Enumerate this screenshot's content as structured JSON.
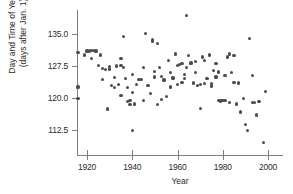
{
  "chart_data": {
    "type": "scatter",
    "title": "",
    "xlabel": "Year",
    "ylabel": "Day and Time of Year\n(days after Jan. 1)",
    "ylabel_lines": [
      "Day and Time of Year",
      "(days after Jan. 1)"
    ],
    "xlim": [
      1915,
      2003
    ],
    "ylim": [
      108.5,
      140.5
    ],
    "xticks": [
      1920,
      1940,
      1960,
      1980,
      2000
    ],
    "xtick_labels": [
      "1920",
      "1940",
      "1960",
      "1980",
      "2000"
    ],
    "yticks": [
      112.5,
      120.0,
      127.5,
      135.0
    ],
    "ytick_labels": [
      "112.5",
      "120.0",
      "127.5",
      "135.0"
    ],
    "grid": false,
    "legend": false,
    "marker": "filled-circle",
    "marker_color": "#4c4c4c",
    "axis_color": "#7d7d7d",
    "n_points": 111,
    "points": [
      {
        "x": 1916,
        "y": 130.6
      },
      {
        "x": 1916,
        "y": 122.6
      },
      {
        "x": 1916,
        "y": 119.8
      },
      {
        "x": 1919,
        "y": 130.1
      },
      {
        "x": 1920,
        "y": 131.0
      },
      {
        "x": 1921,
        "y": 131.0
      },
      {
        "x": 1922,
        "y": 131.2
      },
      {
        "x": 1922,
        "y": 129.3
      },
      {
        "x": 1923,
        "y": 131.1
      },
      {
        "x": 1924,
        "y": 131.0
      },
      {
        "x": 1925,
        "y": 127.6
      },
      {
        "x": 1926,
        "y": 130.1
      },
      {
        "x": 1927,
        "y": 127.0
      },
      {
        "x": 1927,
        "y": 124.4
      },
      {
        "x": 1928,
        "y": 126.7
      },
      {
        "x": 1929,
        "y": 117.4
      },
      {
        "x": 1930,
        "y": 127.4
      },
      {
        "x": 1930,
        "y": 126.8
      },
      {
        "x": 1931,
        "y": 123.0
      },
      {
        "x": 1932,
        "y": 124.8
      },
      {
        "x": 1932,
        "y": 122.4
      },
      {
        "x": 1933,
        "y": 127.5
      },
      {
        "x": 1934,
        "y": 123.1
      },
      {
        "x": 1935,
        "y": 127.6
      },
      {
        "x": 1935,
        "y": 129.2
      },
      {
        "x": 1935,
        "y": 120.6
      },
      {
        "x": 1936,
        "y": 134.4
      },
      {
        "x": 1936,
        "y": 127.2
      },
      {
        "x": 1937,
        "y": 124.5
      },
      {
        "x": 1938,
        "y": 122.4
      },
      {
        "x": 1938,
        "y": 119.2
      },
      {
        "x": 1939,
        "y": 119.5
      },
      {
        "x": 1939,
        "y": 118.5
      },
      {
        "x": 1940,
        "y": 125.6
      },
      {
        "x": 1940,
        "y": 121.3
      },
      {
        "x": 1940,
        "y": 112.3
      },
      {
        "x": 1941,
        "y": 118.6
      },
      {
        "x": 1942,
        "y": 123.2
      },
      {
        "x": 1943,
        "y": 124.3
      },
      {
        "x": 1944,
        "y": 124.4
      },
      {
        "x": 1945,
        "y": 127.1
      },
      {
        "x": 1945,
        "y": 119.5
      },
      {
        "x": 1946,
        "y": 135.2
      },
      {
        "x": 1947,
        "y": 123.0
      },
      {
        "x": 1948,
        "y": 121.1
      },
      {
        "x": 1949,
        "y": 133.3
      },
      {
        "x": 1949,
        "y": 133.6
      },
      {
        "x": 1950,
        "y": 126.2
      },
      {
        "x": 1950,
        "y": 124.9
      },
      {
        "x": 1951,
        "y": 132.7
      },
      {
        "x": 1951,
        "y": 118.5
      },
      {
        "x": 1952,
        "y": 127.1
      },
      {
        "x": 1953,
        "y": 125.1
      },
      {
        "x": 1953,
        "y": 119.6
      },
      {
        "x": 1954,
        "y": 124.2
      },
      {
        "x": 1955,
        "y": 120.4
      },
      {
        "x": 1956,
        "y": 128.7
      },
      {
        "x": 1957,
        "y": 126.0
      },
      {
        "x": 1957,
        "y": 122.6
      },
      {
        "x": 1958,
        "y": 124.7
      },
      {
        "x": 1959,
        "y": 130.3
      },
      {
        "x": 1960,
        "y": 127.6
      },
      {
        "x": 1960,
        "y": 123.1
      },
      {
        "x": 1961,
        "y": 127.9
      },
      {
        "x": 1962,
        "y": 128.0
      },
      {
        "x": 1962,
        "y": 123.6
      },
      {
        "x": 1963,
        "y": 125.5
      },
      {
        "x": 1963,
        "y": 124.5
      },
      {
        "x": 1964,
        "y": 139.3
      },
      {
        "x": 1964,
        "y": 127.2
      },
      {
        "x": 1965,
        "y": 130.0
      },
      {
        "x": 1966,
        "y": 128.2
      },
      {
        "x": 1967,
        "y": 123.5
      },
      {
        "x": 1968,
        "y": 126.0
      },
      {
        "x": 1968,
        "y": 128.6
      },
      {
        "x": 1969,
        "y": 122.9
      },
      {
        "x": 1970,
        "y": 123.2
      },
      {
        "x": 1970,
        "y": 117.5
      },
      {
        "x": 1971,
        "y": 129.6
      },
      {
        "x": 1972,
        "y": 128.8
      },
      {
        "x": 1972,
        "y": 123.4
      },
      {
        "x": 1973,
        "y": 124.5
      },
      {
        "x": 1974,
        "y": 130.1
      },
      {
        "x": 1975,
        "y": 123.4
      },
      {
        "x": 1975,
        "y": 122.8
      },
      {
        "x": 1976,
        "y": 126.4
      },
      {
        "x": 1977,
        "y": 128.1
      },
      {
        "x": 1977,
        "y": 124.9
      },
      {
        "x": 1978,
        "y": 126.1
      },
      {
        "x": 1978,
        "y": 119.5
      },
      {
        "x": 1979,
        "y": 119.3
      },
      {
        "x": 1979,
        "y": 119.4
      },
      {
        "x": 1980,
        "y": 119.4
      },
      {
        "x": 1980,
        "y": 119.5
      },
      {
        "x": 1981,
        "y": 119.4
      },
      {
        "x": 1981,
        "y": 125.3
      },
      {
        "x": 1982,
        "y": 129.6
      },
      {
        "x": 1983,
        "y": 130.3
      },
      {
        "x": 1983,
        "y": 118.9
      },
      {
        "x": 1984,
        "y": 125.9
      },
      {
        "x": 1985,
        "y": 129.9
      },
      {
        "x": 1985,
        "y": 123.7
      },
      {
        "x": 1986,
        "y": 118.6
      },
      {
        "x": 1987,
        "y": 123.5
      },
      {
        "x": 1988,
        "y": 116.7
      },
      {
        "x": 1989,
        "y": 119.8
      },
      {
        "x": 1990,
        "y": 113.8
      },
      {
        "x": 1991,
        "y": 112.4
      },
      {
        "x": 1992,
        "y": 134.0
      },
      {
        "x": 1993,
        "y": 125.3
      },
      {
        "x": 1993,
        "y": 118.9
      },
      {
        "x": 1994,
        "y": 119.0
      },
      {
        "x": 1995,
        "y": 116.0
      },
      {
        "x": 1996,
        "y": 119.2
      },
      {
        "x": 1998,
        "y": 109.6
      },
      {
        "x": 1999,
        "y": 121.6
      }
    ]
  }
}
